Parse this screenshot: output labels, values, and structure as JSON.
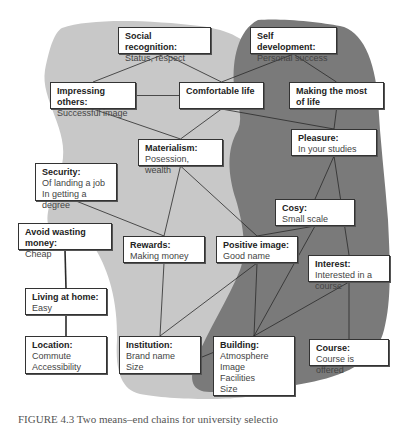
{
  "colors": {
    "light_region": "#c8c8c8",
    "dark_region": "#7a7a7a",
    "line": "#2a2a2a",
    "node_bg": "#ffffff"
  },
  "nodes": {
    "social_recognition": {
      "title": "Social recognition:",
      "lines": [
        "Status, respect"
      ]
    },
    "self_development": {
      "title": "Self development:",
      "lines": [
        "Personal success"
      ]
    },
    "impressing_others": {
      "title": "Impressing others:",
      "lines": [
        "Successful image"
      ]
    },
    "comfortable_life": {
      "title": "Comfortable life",
      "lines": []
    },
    "making_most_of_life": {
      "title": "Making the most of life",
      "lines": []
    },
    "pleasure": {
      "title": "Pleasure:",
      "lines": [
        "In your studies"
      ]
    },
    "materialism": {
      "title": "Materialism:",
      "lines": [
        "Posession, wealth"
      ]
    },
    "security": {
      "title": "Security:",
      "lines": [
        "Of landing a job",
        "In getting a degree"
      ]
    },
    "cosy": {
      "title": "Cosy:",
      "lines": [
        "Small scale"
      ]
    },
    "avoid_wasting_money": {
      "title": "Avoid wasting money:",
      "lines": [
        "Cheap"
      ]
    },
    "rewards": {
      "title": "Rewards:",
      "lines": [
        "Making money"
      ]
    },
    "positive_image": {
      "title": "Positive image:",
      "lines": [
        "Good name"
      ]
    },
    "interest": {
      "title": "Interest:",
      "lines": [
        "Interested in a course"
      ]
    },
    "living_at_home": {
      "title": "Living at home:",
      "lines": [
        "Easy"
      ]
    },
    "location": {
      "title": "Location:",
      "lines": [
        "Commute",
        "Accessibility"
      ]
    },
    "institution": {
      "title": "Institution:",
      "lines": [
        "Brand name",
        "Size"
      ]
    },
    "building": {
      "title": "Building:",
      "lines": [
        "Atmosphere",
        "Image",
        "Facilities",
        "Size"
      ]
    },
    "course": {
      "title": "Course:",
      "lines": [
        "Course is offered"
      ]
    }
  },
  "edges": [
    [
      "social_recognition",
      "impressing_others"
    ],
    [
      "social_recognition",
      "comfortable_life"
    ],
    [
      "self_development",
      "comfortable_life"
    ],
    [
      "self_development",
      "making_most_of_life"
    ],
    [
      "impressing_others",
      "comfortable_life"
    ],
    [
      "impressing_others",
      "materialism"
    ],
    [
      "comfortable_life",
      "materialism"
    ],
    [
      "comfortable_life",
      "pleasure"
    ],
    [
      "making_most_of_life",
      "pleasure"
    ],
    [
      "materialism",
      "rewards"
    ],
    [
      "materialism",
      "positive_image"
    ],
    [
      "security",
      "rewards"
    ],
    [
      "pleasure",
      "cosy"
    ],
    [
      "pleasure",
      "interest"
    ],
    [
      "cosy",
      "positive_image"
    ],
    [
      "cosy",
      "building"
    ],
    [
      "avoid_wasting_money",
      "living_at_home"
    ],
    [
      "living_at_home",
      "location"
    ],
    [
      "rewards",
      "institution"
    ],
    [
      "positive_image",
      "institution"
    ],
    [
      "positive_image",
      "building"
    ],
    [
      "interest",
      "building"
    ],
    [
      "interest",
      "course"
    ],
    [
      "institution",
      "building"
    ]
  ],
  "caption": "FIGURE 4.3  Two means–end chains for university selection"
}
